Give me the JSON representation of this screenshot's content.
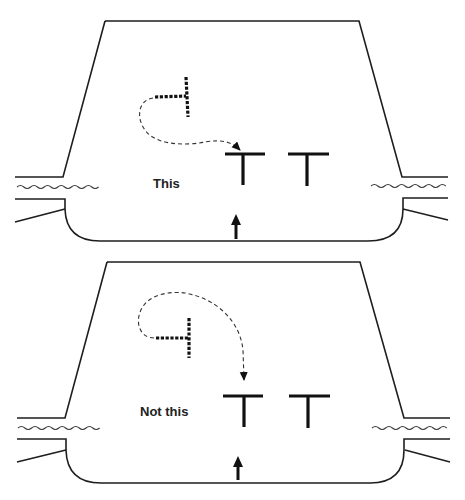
{
  "figure": {
    "panels": [
      {
        "id": "correct",
        "label": "This",
        "description": "Dotted T swings around and lands on top of the lead T bar (approaches from above-left)"
      },
      {
        "id": "incorrect",
        "label": "Not this",
        "description": "Dotted T loops over and drops down vertically onto the lead T"
      }
    ],
    "elements": {
      "container": "tapered-vessel-outline",
      "pipes": "side-inlet-outlet-pipes-with-wavy-lines",
      "objects": [
        "solid-T-shape",
        "solid-T-shape"
      ],
      "moving_object": "dotted-T-shape",
      "motion_path": "dashed-curved-arrow",
      "flow_indicator": "up-arrow"
    },
    "colors": {
      "stroke": "#1e1e1e",
      "background": "#ffffff"
    }
  }
}
